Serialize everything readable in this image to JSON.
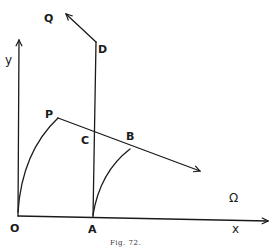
{
  "figure": {
    "caption": "Fig. 72.",
    "axes": {
      "x_label": "x",
      "y_label": "y"
    },
    "points": {
      "O": "O",
      "A": "A",
      "P": "P",
      "C": "C",
      "B": "B",
      "D": "D",
      "Q": "Q"
    },
    "region_label": "Ω",
    "colors": {
      "ink": "#1a1a1a",
      "background": "#ffffff"
    }
  }
}
